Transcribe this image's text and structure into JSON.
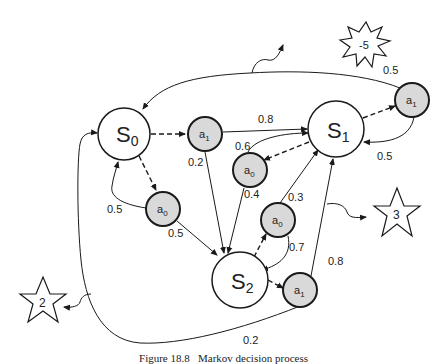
{
  "diagram": {
    "type": "markov-decision-process",
    "states": [
      {
        "id": "s0",
        "label": "S",
        "sub": "0",
        "cx": 124,
        "cy": 134,
        "r": 26
      },
      {
        "id": "s1",
        "label": "S",
        "sub": "1",
        "cx": 336,
        "cy": 129,
        "r": 28
      },
      {
        "id": "s2",
        "label": "S",
        "sub": "2",
        "cx": 240,
        "cy": 280,
        "r": 28
      }
    ],
    "actions": [
      {
        "id": "s0a1",
        "label": "a",
        "sub": "1",
        "cx": 205,
        "cy": 134
      },
      {
        "id": "s0a0",
        "label": "a",
        "sub": "0",
        "cx": 163,
        "cy": 209
      },
      {
        "id": "s1a0",
        "label": "a",
        "sub": "0",
        "cx": 250,
        "cy": 170
      },
      {
        "id": "s1a1",
        "label": "a",
        "sub": "1",
        "cx": 412,
        "cy": 100
      },
      {
        "id": "s2a0",
        "label": "a",
        "sub": "0",
        "cx": 278,
        "cy": 220
      },
      {
        "id": "s2a1",
        "label": "a",
        "sub": "1",
        "cx": 300,
        "cy": 290
      }
    ],
    "transitions": [
      {
        "from": "s0a1",
        "to": "s1",
        "prob": "0.8"
      },
      {
        "from": "s0a1",
        "to": "s2",
        "prob": "0.2"
      },
      {
        "from": "s0a0",
        "to": "s0",
        "prob": "0.5"
      },
      {
        "from": "s0a0",
        "to": "s2",
        "prob": "0.5"
      },
      {
        "from": "s1a0",
        "to": "s1",
        "prob": "0.6"
      },
      {
        "from": "s1a0",
        "to": "s2",
        "prob": "0.4"
      },
      {
        "from": "s1a1",
        "to": "s0",
        "prob": "0.5"
      },
      {
        "from": "s1a1",
        "to": "s1",
        "prob": "0.5"
      },
      {
        "from": "s2a0",
        "to": "s1",
        "prob": "0.3"
      },
      {
        "from": "s2a0",
        "to": "s2",
        "prob": "0.7"
      },
      {
        "from": "s2a1",
        "to": "s1",
        "prob": "0.8"
      },
      {
        "from": "s2a1",
        "to": "s0",
        "prob": "0.2"
      }
    ],
    "rewards": [
      {
        "id": "reward-neg5",
        "shape": "burst",
        "value": "-5"
      },
      {
        "id": "reward-3",
        "shape": "star",
        "value": "3"
      },
      {
        "id": "reward-2",
        "shape": "star",
        "value": "2"
      }
    ],
    "labels": {
      "p_s0a1_s1": "0.8",
      "p_s0a1_s2": "0.2",
      "p_s0a0_s0": "0.5",
      "p_s0a0_s2": "0.5",
      "p_s1a0_s1": "0.6",
      "p_s1a0_s2": "0.4",
      "p_s1a1_s0": "0.5",
      "p_s1a1_s1": "0.5",
      "p_s2a0_s1": "0.3",
      "p_s2a0_s2": "0.7",
      "p_s2a1_s1": "0.8",
      "p_s2a1_s0": "0.2",
      "reward_neg5": "-5",
      "reward_3": "3",
      "reward_2": "2"
    },
    "colors": {
      "state_fill": "#ffffff",
      "action_fill": "#d9d9d9",
      "stroke": "#1a1a1a"
    }
  },
  "caption": "Figure 18.8   Markov decision process"
}
